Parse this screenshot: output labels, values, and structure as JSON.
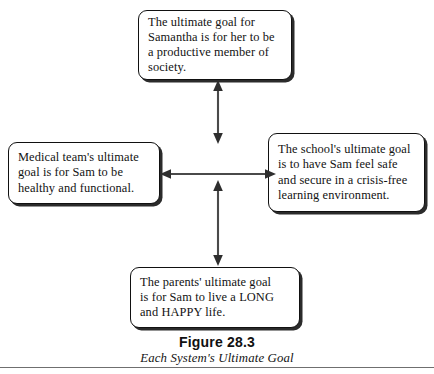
{
  "figure": {
    "caption_title": "Figure 28.3",
    "caption_subtitle": "Each System's Ultimate Goal",
    "boxes": {
      "top": {
        "name": "samantha-goal",
        "text": "The ultimate goal for\nSamantha is for her to be\na productive member of\nsociety."
      },
      "left": {
        "name": "medical-team-goal",
        "text": "Medical team's ultimate\ngoal is for Sam to be\nhealthy and functional."
      },
      "right": {
        "name": "school-goal",
        "text": "The school's ultimate goal\nis to have Sam feel safe\nand secure in a crisis-free\nlearning environment."
      },
      "bottom": {
        "name": "parents-goal",
        "text": "The parents' ultimate goal\nis for Sam to live a LONG\nand HAPPY life."
      }
    },
    "connectors": [
      {
        "name": "arrow-vertical-top",
        "style": "double-headed",
        "orientation": "vertical"
      },
      {
        "name": "arrow-horizontal",
        "style": "double-headed",
        "orientation": "horizontal"
      },
      {
        "name": "arrow-vertical-bottom",
        "style": "double-headed",
        "orientation": "vertical"
      }
    ],
    "colors": {
      "box_border": "#111111",
      "box_shadow": "#2b2b2b",
      "arrow": "#4a4a4a",
      "text": "#121212",
      "rule": "#6f6f6f",
      "background": "#ffffff"
    }
  }
}
